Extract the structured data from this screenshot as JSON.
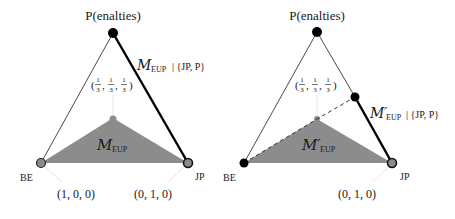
{
  "colors": {
    "polygon_fill": "#8c8c8c",
    "edge": "#1a1a1a",
    "guide": "#e0e0e0",
    "vertex_gray": "#8a8a8a",
    "vertex_black": "#000000"
  },
  "left_panel": {
    "top_label": "P(enalties)",
    "centroid_label": "(1/3, 1/3, 1/3)",
    "polygon_label_main": "M",
    "polygon_label_sub": "EUP",
    "edge_label_main": "M",
    "edge_label_sub": "EUP",
    "edge_label_rest": "| {JP, P}",
    "vertex_left": "BE",
    "vertex_right": "JP",
    "coord_left": "(1, 0, 0)",
    "coord_right": "(0, 1, 0)"
  },
  "right_panel": {
    "top_label": "P(enalties)",
    "centroid_label": "(1/3, 1/3, 1/3)",
    "polygon_label_main": "M′",
    "polygon_label_sub": "EUP",
    "edge_label_main": "M′",
    "edge_label_sub": "EUP",
    "edge_label_rest": "| {JP, P}",
    "vertex_left": "BE",
    "vertex_right": "JP",
    "coord_right": "(0, 1, 0)"
  },
  "fractions": {
    "num": "1",
    "den": "3"
  }
}
